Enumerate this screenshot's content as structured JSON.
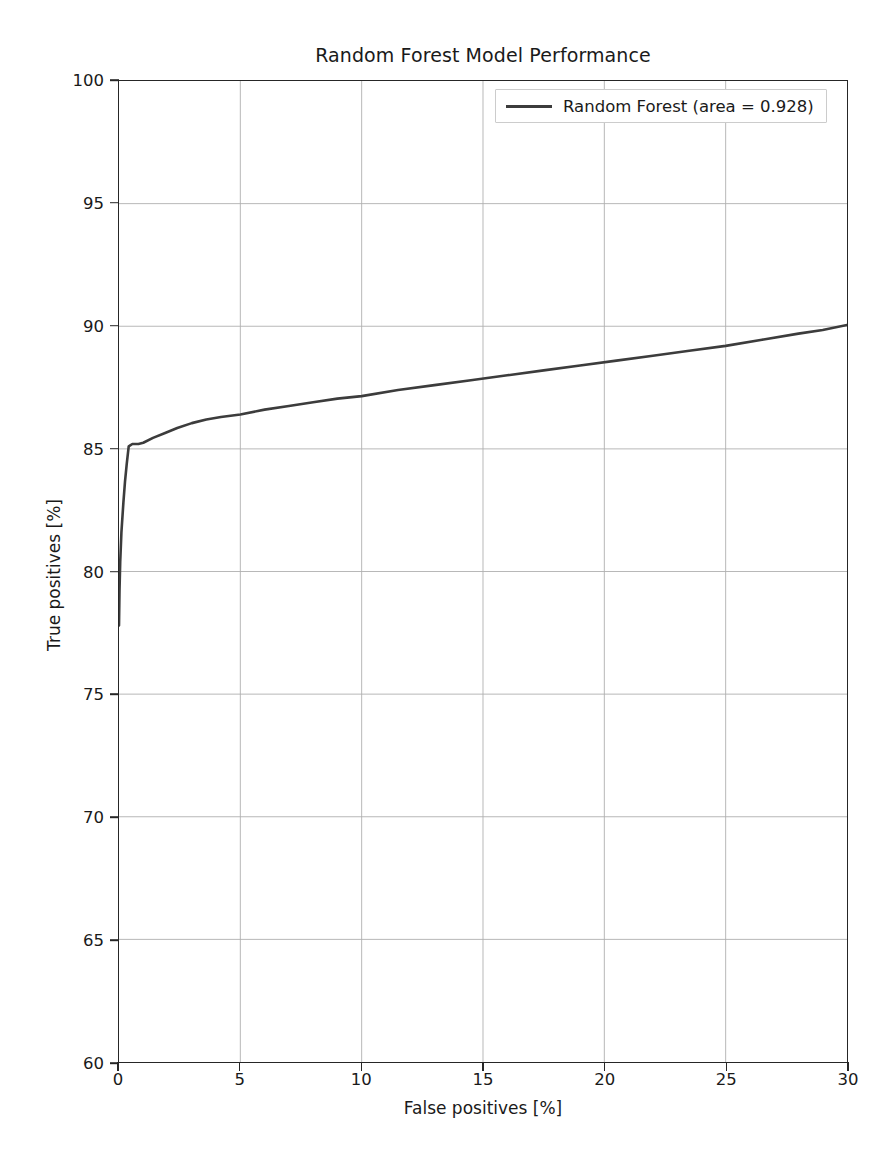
{
  "chart_data": {
    "type": "line",
    "title": "Random Forest Model Performance",
    "xlabel": "False positives [%]",
    "ylabel": "True positives [%]",
    "xlim": [
      0,
      30
    ],
    "ylim": [
      60,
      100
    ],
    "xticks": [
      0,
      5,
      10,
      15,
      20,
      25,
      30
    ],
    "yticks": [
      60,
      65,
      70,
      75,
      80,
      85,
      90,
      95,
      100
    ],
    "grid": true,
    "grid_color": "#b0b0b0",
    "legend_position": "upper right",
    "line_color": "#3c3c3c",
    "series": [
      {
        "name": "Random Forest (area = 0.928)",
        "area": 0.928,
        "x": [
          0.0,
          0.02,
          0.05,
          0.1,
          0.18,
          0.25,
          0.32,
          0.4,
          0.55,
          0.8,
          1.0,
          1.4,
          1.9,
          2.4,
          3.0,
          3.6,
          4.2,
          5.0,
          6.0,
          7.0,
          8.0,
          9.0,
          10.0,
          11.5,
          13.0,
          14.5,
          16.0,
          17.5,
          19.0,
          20.5,
          22.0,
          23.5,
          25.0,
          26.5,
          28.0,
          29.0,
          30.0
        ],
        "y": [
          77.8,
          79.2,
          80.4,
          81.6,
          82.8,
          83.7,
          84.4,
          85.1,
          85.2,
          85.2,
          85.25,
          85.45,
          85.65,
          85.85,
          86.05,
          86.2,
          86.3,
          86.4,
          86.6,
          86.75,
          86.9,
          87.05,
          87.15,
          87.4,
          87.6,
          87.8,
          88.0,
          88.2,
          88.4,
          88.6,
          88.8,
          89.0,
          89.2,
          89.45,
          89.7,
          89.85,
          90.05
        ]
      }
    ]
  },
  "legend": {
    "entries": [
      {
        "label": "Random Forest (area = 0.928)",
        "color": "#3c3c3c"
      }
    ]
  }
}
